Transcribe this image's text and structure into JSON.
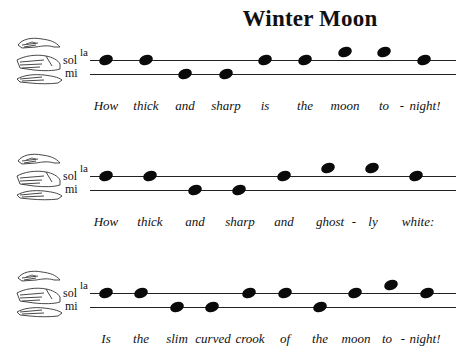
{
  "title": "Winter Moon",
  "solfege_labels": {
    "la": "la",
    "sol": "sol",
    "mi": "mi"
  },
  "systems": [
    {
      "notes": [
        "sol",
        "sol",
        "mi",
        "mi",
        "sol",
        "sol",
        "la",
        "la",
        "sol"
      ],
      "note_x": [
        106,
        146,
        185,
        226,
        265,
        305,
        345,
        384,
        424
      ],
      "lyrics": [
        {
          "text": "How",
          "x": 106
        },
        {
          "text": "thick",
          "x": 146
        },
        {
          "text": "and",
          "x": 185
        },
        {
          "text": "sharp",
          "x": 226
        },
        {
          "text": "is",
          "x": 265
        },
        {
          "text": "the",
          "x": 305
        },
        {
          "text": "moon",
          "x": 345
        },
        {
          "text": "to",
          "x": 384
        },
        {
          "text": "-",
          "x": 402
        },
        {
          "text": "night!",
          "x": 425
        }
      ]
    },
    {
      "notes": [
        "sol",
        "sol",
        "mi",
        "mi",
        "sol",
        "la",
        "la",
        "sol"
      ],
      "note_x": [
        106,
        150,
        195,
        239,
        284,
        328,
        372,
        416
      ],
      "lyrics": [
        {
          "text": "How",
          "x": 106
        },
        {
          "text": "thick",
          "x": 150
        },
        {
          "text": "and",
          "x": 195
        },
        {
          "text": "sharp",
          "x": 240
        },
        {
          "text": "and",
          "x": 284
        },
        {
          "text": "ghost",
          "x": 330
        },
        {
          "text": "-",
          "x": 354
        },
        {
          "text": "ly",
          "x": 373
        },
        {
          "text": "white:",
          "x": 418
        }
      ]
    },
    {
      "notes": [
        "sol",
        "sol",
        "mi",
        "mi",
        "sol",
        "sol",
        "mi",
        "sol",
        "la",
        "sol"
      ],
      "note_x": [
        106,
        141,
        177,
        212,
        249,
        285,
        320,
        355,
        391,
        427
      ],
      "lyrics": [
        {
          "text": "Is",
          "x": 106
        },
        {
          "text": "the",
          "x": 141
        },
        {
          "text": "slim",
          "x": 177
        },
        {
          "text": "curved",
          "x": 213
        },
        {
          "text": "crook",
          "x": 250
        },
        {
          "text": "of",
          "x": 285
        },
        {
          "text": "the",
          "x": 320
        },
        {
          "text": "moon",
          "x": 356
        },
        {
          "text": "to",
          "x": 387
        },
        {
          "text": "-",
          "x": 403
        },
        {
          "text": "night!",
          "x": 425
        }
      ]
    }
  ]
}
